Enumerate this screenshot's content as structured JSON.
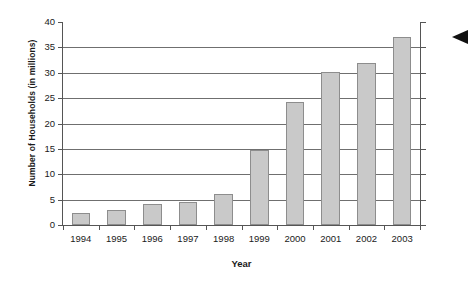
{
  "chart_data": {
    "type": "bar",
    "title": "",
    "xlabel": "Year",
    "ylabel": "Number of Households (in millions)",
    "categories": [
      "1994",
      "1995",
      "1996",
      "1997",
      "1998",
      "1999",
      "2000",
      "2001",
      "2002",
      "2003"
    ],
    "values": [
      2.4,
      2.9,
      4.1,
      4.6,
      6.1,
      14.8,
      24.3,
      30.2,
      32.0,
      37.0
    ],
    "ylim": [
      0,
      40
    ],
    "ytick_step": 5,
    "yticks": [
      "0",
      "5",
      "10",
      "15",
      "20",
      "25",
      "30",
      "35",
      "40"
    ],
    "grid": true,
    "legend": "none",
    "bar_color": "#c9c9c9",
    "bar_border_color": "#8d8d8d",
    "axis_color": "#555555",
    "gridline_color": "#6f6f6f"
  },
  "annotations": {
    "pointer_arrow": "left-pointing-arrow"
  }
}
